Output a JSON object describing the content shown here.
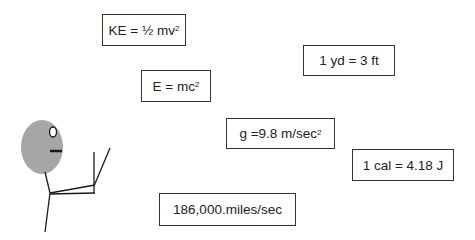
{
  "formulas": [
    {
      "id": "kinetic-energy",
      "text": "KE = ½ mv",
      "superscript": "2"
    },
    {
      "id": "mass-energy",
      "text": "E = mc",
      "superscript": "2"
    },
    {
      "id": "yard-feet",
      "text": "1 yd = 3 ft",
      "superscript": ""
    },
    {
      "id": "gravity",
      "text": "g =9.8 m/sec",
      "superscript": "2"
    },
    {
      "id": "calorie-joule",
      "text": "1 cal = 4.18 J",
      "superscript": ""
    },
    {
      "id": "speed-of-light",
      "text": "186,000.miles/sec",
      "superscript": ""
    }
  ],
  "figure": {
    "head_color": "#a6a6a6",
    "line_color": "#1a1a1a"
  }
}
